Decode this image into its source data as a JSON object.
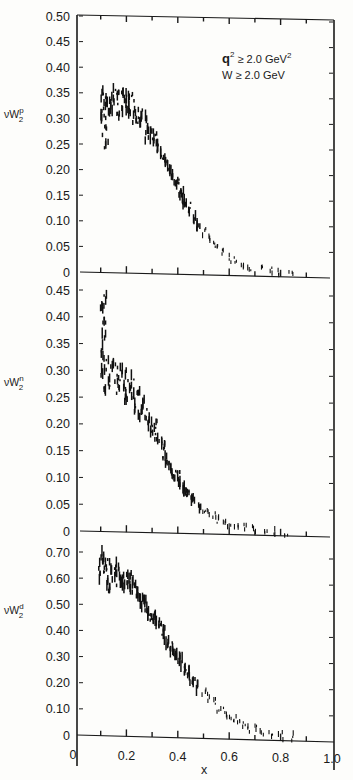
{
  "chart_data": [
    {
      "type": "scatter",
      "panel": "top",
      "ylabel": "νW₂ᵖ",
      "ylabel_main": "νW",
      "ylabel_sub": "2",
      "ylabel_sup": "p",
      "ylim": [
        0,
        0.5
      ],
      "yticks": [
        "0",
        "0.05",
        "0.10",
        "0.15",
        "0.20",
        "0.25",
        "0.30",
        "0.35",
        "0.40",
        "0.45",
        "0.50"
      ],
      "yvalues": [
        0,
        0.05,
        0.1,
        0.15,
        0.2,
        0.25,
        0.3,
        0.35,
        0.4,
        0.45,
        0.5
      ],
      "annotations": [
        {
          "text": "q² ≥ 2.0 GeV²",
          "main": "q",
          "sup": "2",
          "rest": " ≥ 2.0 GeV",
          "sup2": "2"
        },
        {
          "text": "W ≥ 2.0 GeV",
          "main": "W ≥ 2.0 GeV"
        }
      ],
      "series": [
        {
          "name": "proton",
          "points": [
            [
              0.11,
              0.35
            ],
            [
              0.11,
              0.32
            ],
            [
              0.11,
              0.3
            ],
            [
              0.115,
              0.28
            ],
            [
              0.12,
              0.33
            ],
            [
              0.12,
              0.25
            ],
            [
              0.13,
              0.34
            ],
            [
              0.14,
              0.31
            ],
            [
              0.15,
              0.35
            ],
            [
              0.16,
              0.32
            ],
            [
              0.17,
              0.34
            ],
            [
              0.18,
              0.31
            ],
            [
              0.19,
              0.34
            ],
            [
              0.2,
              0.35
            ],
            [
              0.2,
              0.33
            ],
            [
              0.21,
              0.32
            ],
            [
              0.22,
              0.34
            ],
            [
              0.23,
              0.3
            ],
            [
              0.24,
              0.31
            ],
            [
              0.25,
              0.29
            ],
            [
              0.26,
              0.3
            ],
            [
              0.27,
              0.31
            ],
            [
              0.28,
              0.27
            ],
            [
              0.29,
              0.28
            ],
            [
              0.3,
              0.26
            ],
            [
              0.31,
              0.27
            ],
            [
              0.32,
              0.25
            ],
            [
              0.33,
              0.24
            ],
            [
              0.34,
              0.23
            ],
            [
              0.35,
              0.22
            ],
            [
              0.36,
              0.21
            ],
            [
              0.37,
              0.2
            ],
            [
              0.38,
              0.19
            ],
            [
              0.39,
              0.17
            ],
            [
              0.4,
              0.18
            ],
            [
              0.41,
              0.15
            ],
            [
              0.42,
              0.16
            ],
            [
              0.43,
              0.14
            ],
            [
              0.44,
              0.13
            ],
            [
              0.45,
              0.12
            ],
            [
              0.46,
              0.11
            ],
            [
              0.47,
              0.1
            ],
            [
              0.48,
              0.09
            ],
            [
              0.5,
              0.08
            ],
            [
              0.52,
              0.07
            ],
            [
              0.54,
              0.06
            ],
            [
              0.56,
              0.05
            ],
            [
              0.58,
              0.04
            ],
            [
              0.6,
              0.03
            ],
            [
              0.62,
              0.025
            ],
            [
              0.65,
              0.02
            ],
            [
              0.68,
              0.015
            ],
            [
              0.72,
              0.01
            ],
            [
              0.76,
              0.007
            ],
            [
              0.8,
              0.004
            ],
            [
              0.84,
              0.002
            ]
          ]
        }
      ]
    },
    {
      "type": "scatter",
      "panel": "middle",
      "ylabel": "νW₂ⁿ",
      "ylabel_main": "νW",
      "ylabel_sub": "2",
      "ylabel_sup": "n",
      "ylim": [
        0,
        0.45
      ],
      "yticks": [
        "0",
        "0.05",
        "0.10",
        "0.15",
        "0.20",
        "0.25",
        "0.30",
        "0.35",
        "0.40",
        "0.45"
      ],
      "yvalues": [
        0,
        0.05,
        0.1,
        0.15,
        0.2,
        0.25,
        0.3,
        0.35,
        0.4,
        0.45
      ],
      "series": [
        {
          "name": "neutron",
          "points": [
            [
              0.1,
              0.42
            ],
            [
              0.11,
              0.39
            ],
            [
              0.11,
              0.36
            ],
            [
              0.11,
              0.33
            ],
            [
              0.11,
              0.3
            ],
            [
              0.11,
              0.26
            ],
            [
              0.12,
              0.43
            ],
            [
              0.13,
              0.31
            ],
            [
              0.14,
              0.28
            ],
            [
              0.15,
              0.31
            ],
            [
              0.16,
              0.27
            ],
            [
              0.17,
              0.3
            ],
            [
              0.18,
              0.28
            ],
            [
              0.19,
              0.3
            ],
            [
              0.2,
              0.27
            ],
            [
              0.2,
              0.24
            ],
            [
              0.21,
              0.26
            ],
            [
              0.22,
              0.28
            ],
            [
              0.23,
              0.25
            ],
            [
              0.24,
              0.23
            ],
            [
              0.25,
              0.26
            ],
            [
              0.26,
              0.22
            ],
            [
              0.27,
              0.24
            ],
            [
              0.28,
              0.21
            ],
            [
              0.29,
              0.2
            ],
            [
              0.3,
              0.19
            ],
            [
              0.31,
              0.2
            ],
            [
              0.32,
              0.18
            ],
            [
              0.33,
              0.17
            ],
            [
              0.34,
              0.16
            ],
            [
              0.35,
              0.14
            ],
            [
              0.36,
              0.13
            ],
            [
              0.37,
              0.12
            ],
            [
              0.38,
              0.11
            ],
            [
              0.39,
              0.1
            ],
            [
              0.4,
              0.11
            ],
            [
              0.41,
              0.09
            ],
            [
              0.42,
              0.08
            ],
            [
              0.43,
              0.08
            ],
            [
              0.44,
              0.07
            ],
            [
              0.45,
              0.06
            ],
            [
              0.46,
              0.06
            ],
            [
              0.48,
              0.05
            ],
            [
              0.5,
              0.04
            ],
            [
              0.52,
              0.035
            ],
            [
              0.54,
              0.03
            ],
            [
              0.56,
              0.025
            ],
            [
              0.58,
              0.02
            ],
            [
              0.6,
              0.015
            ],
            [
              0.63,
              0.012
            ],
            [
              0.66,
              0.01
            ],
            [
              0.7,
              0.007
            ],
            [
              0.74,
              0.005
            ],
            [
              0.78,
              0.003
            ],
            [
              0.82,
              0.002
            ]
          ]
        }
      ]
    },
    {
      "type": "scatter",
      "panel": "bottom",
      "ylabel": "νW₂ᵈ",
      "ylabel_main": "νW",
      "ylabel_sub": "2",
      "ylabel_sup": "d",
      "ylim": [
        0,
        0.7
      ],
      "yticks": [
        "0",
        "0.10",
        "0.20",
        "0.30",
        "0.40",
        "0.50",
        "0.60",
        "0.70"
      ],
      "yvalues": [
        0,
        0.1,
        0.2,
        0.3,
        0.4,
        0.5,
        0.6,
        0.7
      ],
      "xlabel": "x",
      "xlim": [
        0,
        1.0
      ],
      "xticks": [
        "0",
        "0.2",
        "0.4",
        "0.6",
        "0.8",
        "1.0"
      ],
      "xvalues": [
        0,
        0.2,
        0.4,
        0.6,
        0.8,
        1.0
      ],
      "series": [
        {
          "name": "deuteron",
          "points": [
            [
              0.1,
              0.66
            ],
            [
              0.1,
              0.62
            ],
            [
              0.11,
              0.68
            ],
            [
              0.12,
              0.64
            ],
            [
              0.12,
              0.6
            ],
            [
              0.13,
              0.66
            ],
            [
              0.14,
              0.55
            ],
            [
              0.15,
              0.62
            ],
            [
              0.16,
              0.64
            ],
            [
              0.17,
              0.6
            ],
            [
              0.18,
              0.62
            ],
            [
              0.19,
              0.58
            ],
            [
              0.2,
              0.6
            ],
            [
              0.21,
              0.61
            ],
            [
              0.22,
              0.57
            ],
            [
              0.23,
              0.56
            ],
            [
              0.24,
              0.54
            ],
            [
              0.25,
              0.52
            ],
            [
              0.26,
              0.51
            ],
            [
              0.27,
              0.52
            ],
            [
              0.28,
              0.48
            ],
            [
              0.29,
              0.47
            ],
            [
              0.3,
              0.45
            ],
            [
              0.31,
              0.46
            ],
            [
              0.32,
              0.43
            ],
            [
              0.33,
              0.42
            ],
            [
              0.34,
              0.4
            ],
            [
              0.35,
              0.38
            ],
            [
              0.36,
              0.36
            ],
            [
              0.37,
              0.35
            ],
            [
              0.38,
              0.33
            ],
            [
              0.39,
              0.32
            ],
            [
              0.4,
              0.3
            ],
            [
              0.41,
              0.29
            ],
            [
              0.42,
              0.27
            ],
            [
              0.43,
              0.25
            ],
            [
              0.44,
              0.24
            ],
            [
              0.45,
              0.22
            ],
            [
              0.46,
              0.21
            ],
            [
              0.48,
              0.19
            ],
            [
              0.5,
              0.17
            ],
            [
              0.52,
              0.15
            ],
            [
              0.54,
              0.13
            ],
            [
              0.56,
              0.11
            ],
            [
              0.58,
              0.1
            ],
            [
              0.6,
              0.08
            ],
            [
              0.62,
              0.07
            ],
            [
              0.64,
              0.06
            ],
            [
              0.66,
              0.045
            ],
            [
              0.68,
              0.035
            ],
            [
              0.7,
              0.03
            ],
            [
              0.73,
              0.02
            ],
            [
              0.76,
              0.014
            ],
            [
              0.8,
              0.008
            ],
            [
              0.84,
              0.004
            ]
          ]
        }
      ]
    }
  ]
}
